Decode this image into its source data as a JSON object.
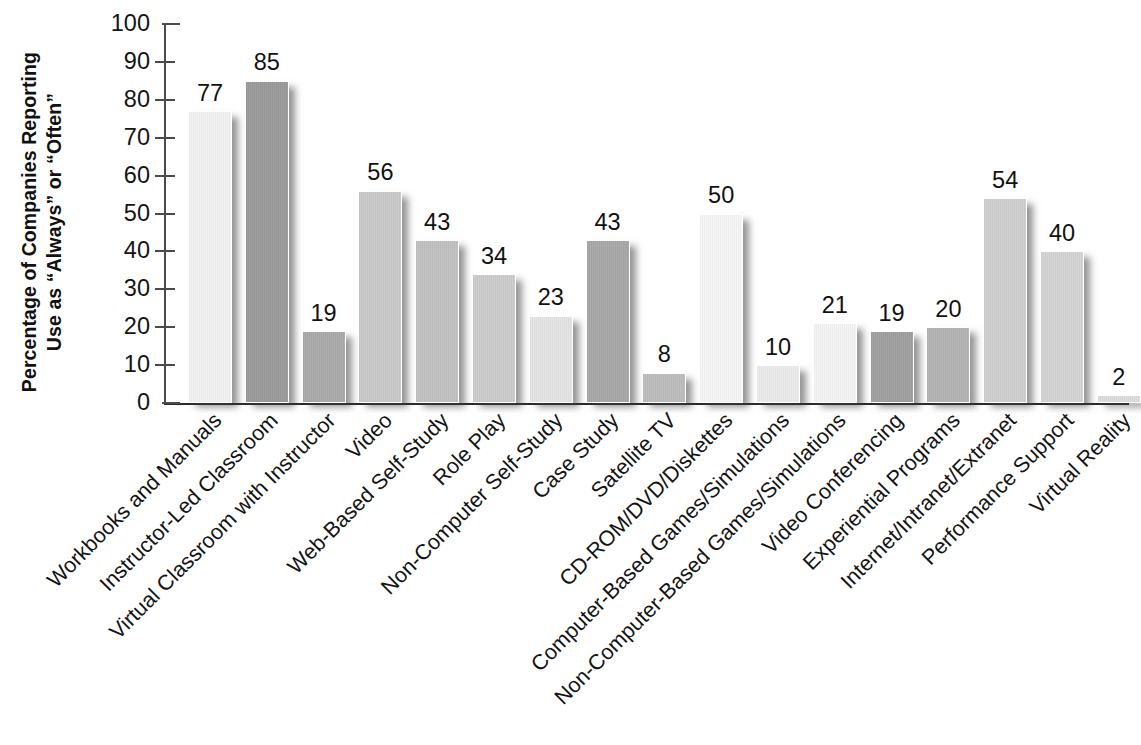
{
  "chart_data": {
    "type": "bar",
    "title": "",
    "subtitle": "",
    "xlabel": "",
    "ylabel": "Percentage of Companies Reporting Use as \"Always\" or \"Often\"",
    "ylabel_lines": [
      "Percentage of Companies Reporting",
      "Use as “Always” or “Often”"
    ],
    "ylim": [
      0,
      100
    ],
    "ytick_values": [
      0,
      10,
      20,
      30,
      40,
      50,
      60,
      70,
      80,
      90,
      100
    ],
    "ytick_labels": [
      "0",
      "10",
      "20",
      "30",
      "40",
      "50",
      "60",
      "70",
      "80",
      "90",
      "100"
    ],
    "grid": false,
    "legend": null,
    "legend_position": "none",
    "categories": [
      "Workbooks and Manuals",
      "Instructor-Led Classroom",
      "Virtual Classroom with Instructor",
      "Video",
      "Web-Based Self-Study",
      "Role Play",
      "Non-Computer Self-Study",
      "Case Study",
      "Satellite TV",
      "CD-ROM/DVD/Diskettes",
      "Computer-Based Games/Simulations",
      "Non-Computer-Based Games/Simulations",
      "Video Conferencing",
      "Experiential Programs",
      "Internet/Intranet/Extranet",
      "Performance Support",
      "Virtual Reality"
    ],
    "values": [
      77,
      85,
      19,
      56,
      43,
      34,
      23,
      43,
      8,
      50,
      10,
      21,
      19,
      20,
      54,
      40,
      2
    ],
    "value_labels": [
      "77",
      "85",
      "19",
      "56",
      "43",
      "34",
      "23",
      "43",
      "8",
      "50",
      "10",
      "21",
      "19",
      "20",
      "54",
      "40",
      "2"
    ],
    "bar_colors": [
      "#f2f2f2",
      "#9a9a9a",
      "#aaaaaa",
      "#c9c9c9",
      "#c2c2c2",
      "#cccccc",
      "#e4e4e4",
      "#a8a8a8",
      "#bdbdbd",
      "#f6f6f6",
      "#ebebeb",
      "#f4f4f4",
      "#a0a0a0",
      "#b4b4b4",
      "#cfcfcf",
      "#d4d4d4",
      "#dddddd"
    ],
    "axis_color": "#3c3c3c",
    "text_color": "#141414",
    "background": "#ffffff"
  }
}
